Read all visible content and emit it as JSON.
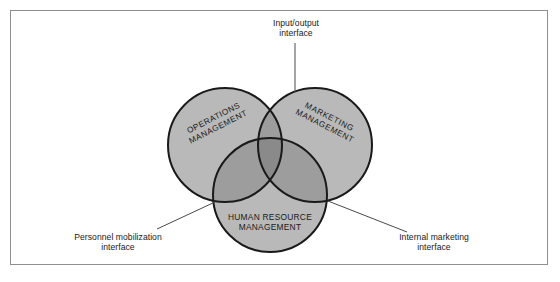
{
  "figure": {
    "type": "venn-diagram-3-circle",
    "frame_border_color": "#8f8f8f",
    "background_color": "#ffffff"
  },
  "colors": {
    "circle_fill": "#b9b9b9",
    "circle_stroke": "#1a1a1a",
    "overlap_two": "#9d9d9d",
    "overlap_three": "#8a8a8a",
    "leader_line": "#4a4a4a",
    "text": "#1a1a1a"
  },
  "circles": [
    {
      "id": "operations",
      "label_line1": "OPERATIONS",
      "label_line2": "MANAGEMENT",
      "cx": 215,
      "cy": 135,
      "r": 57,
      "rotation_deg": -27
    },
    {
      "id": "marketing",
      "label_line1": "MARKETING",
      "label_line2": "MANAGEMENT",
      "cx": 305,
      "cy": 135,
      "r": 57,
      "rotation_deg": 27
    },
    {
      "id": "human-resource",
      "label_line1": "HUMAN RESOURCE",
      "label_line2": "MANAGEMENT",
      "cx": 260,
      "cy": 185,
      "r": 57,
      "rotation_deg": 0
    }
  ],
  "callouts": [
    {
      "id": "input-output",
      "line1": "Input/output",
      "line2": "interface",
      "leader": {
        "x1": 285,
        "y1": 33,
        "x2": 285,
        "y2": 82
      }
    },
    {
      "id": "personnel-mobilization",
      "line1": "Personnel mobilization",
      "line2": "interface",
      "leader": {
        "x1": 147,
        "y1": 219,
        "x2": 205,
        "y2": 192
      }
    },
    {
      "id": "internal-marketing",
      "line1": "Internal marketing",
      "line2": "interface",
      "leader": {
        "x1": 318,
        "y1": 191,
        "x2": 397,
        "y2": 222
      }
    }
  ],
  "caption": {
    "text": ""
  }
}
